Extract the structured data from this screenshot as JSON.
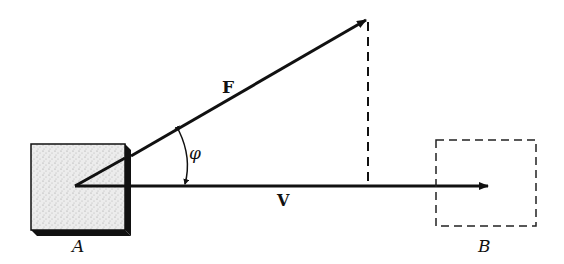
{
  "diagram": {
    "labels": {
      "force": "F",
      "velocity": "V",
      "angle": "φ",
      "start_block": "A",
      "end_block": "B"
    },
    "colors": {
      "ink": "#111111",
      "block_fill": "#e6e6e6",
      "background": "#ffffff"
    }
  }
}
